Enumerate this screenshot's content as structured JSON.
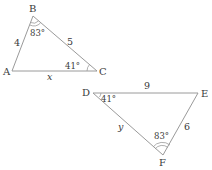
{
  "triangle1": {
    "vertices": {
      "A": "A",
      "B": "B",
      "C": "C"
    },
    "sides": {
      "AB": "4",
      "BC": "5",
      "AC": "x"
    },
    "angles": {
      "B": "83°",
      "C": "41°"
    }
  },
  "triangle2": {
    "vertices": {
      "D": "D",
      "E": "E",
      "F": "F"
    },
    "sides": {
      "DE": "9",
      "EF": "6",
      "DF": "y"
    },
    "angles": {
      "D": "41°",
      "F": "83°"
    }
  },
  "colors": {
    "line": "#9a9a9a",
    "text": "#3a3a3a"
  }
}
